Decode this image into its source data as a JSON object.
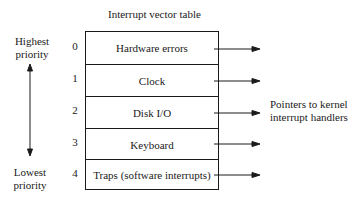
{
  "diagram": {
    "title": "Interrupt vector table",
    "priority_high": [
      "Highest",
      "priority"
    ],
    "priority_low": [
      "Lowest",
      "priority"
    ],
    "entries": [
      {
        "index": "0",
        "label": "Hardware errors"
      },
      {
        "index": "1",
        "label": "Clock"
      },
      {
        "index": "2",
        "label": "Disk I/O"
      },
      {
        "index": "3",
        "label": "Keyboard"
      },
      {
        "index": "4",
        "label": "Traps (software interrupts)"
      }
    ],
    "pointer_label": [
      "Pointers to kernel",
      "interrupt handlers"
    ]
  }
}
